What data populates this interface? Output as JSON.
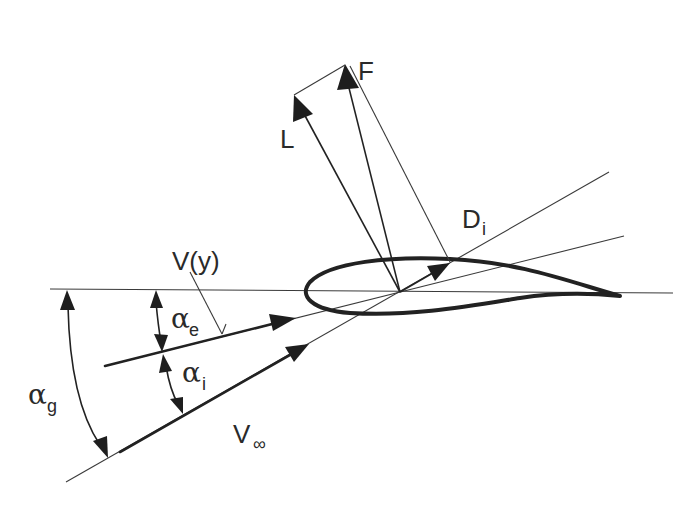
{
  "diagram": {
    "labels": {
      "lift": "L",
      "force": "F",
      "induced_drag_main": "D",
      "induced_drag_sub": "i",
      "downwash_main": "V(y)",
      "freestream_main": "V",
      "freestream_sub": "∞",
      "alpha_e_main": "α",
      "alpha_e_sub": "e",
      "alpha_i_main": "α",
      "alpha_i_sub": "i",
      "alpha_g_main": "α",
      "alpha_g_sub": "g"
    },
    "elements": [
      "horizontal-reference-line",
      "airfoil",
      "freestream-velocity-vector",
      "effective-velocity-vector",
      "downwash-line",
      "lift-vector",
      "resultant-force-vector",
      "induced-drag-vector",
      "alpha-e-arc",
      "alpha-i-arc",
      "alpha-g-arc"
    ],
    "colors": {
      "ink": "#222222",
      "background": "#ffffff"
    }
  }
}
